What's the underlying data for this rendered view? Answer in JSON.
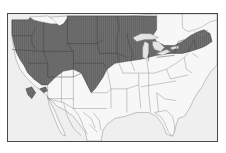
{
  "map": {
    "type": "range-map",
    "region": "North America (United States, southern Canada, northern Mexico)",
    "colors": {
      "background": "#efefef",
      "land": "#f6f6f6",
      "range_fill": "#707070",
      "range_hatch": "#5a5a5a",
      "borders": "#6a6a6a",
      "range_borders": "#3a3a3a",
      "frame": "#4a4a4a",
      "water": "#e2e2e2"
    },
    "layers": [
      {
        "name": "land",
        "label": ""
      },
      {
        "name": "species-range",
        "label": ""
      },
      {
        "name": "state-borders",
        "label": ""
      },
      {
        "name": "great-lakes",
        "label": ""
      }
    ]
  }
}
